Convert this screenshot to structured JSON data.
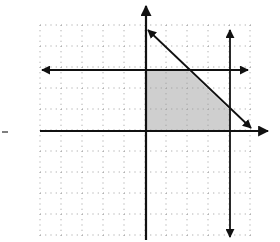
{
  "diagram": {
    "type": "coordinate-plane-linear-inequalities",
    "grid": {
      "x_min_px": 40,
      "x_max_px": 252,
      "y_min_px": 25,
      "y_max_px": 238,
      "major_step_px": 21,
      "minor_divisions": 4,
      "style": "dotted",
      "color": "#9a9a9a"
    },
    "axes": {
      "x_axis": {
        "y_px": 131,
        "from_x": 40,
        "to_x": 268,
        "arrow": "right"
      },
      "y_axis": {
        "x_px": 146,
        "from_y": 6,
        "to_y": 240,
        "arrow": "up"
      }
    },
    "lines": [
      {
        "name": "horizontal-boundary",
        "x1": 42,
        "y1": 70,
        "x2": 248,
        "y2": 70,
        "arrows": "both"
      },
      {
        "name": "vertical-boundary",
        "x1": 230,
        "y1": 30,
        "x2": 230,
        "y2": 237,
        "arrows": "both"
      },
      {
        "name": "diagonal-boundary",
        "x1": 148,
        "y1": 30,
        "x2": 251,
        "y2": 128,
        "arrows": "both"
      }
    ],
    "shaded_region": {
      "points": [
        [
          147,
          70
        ],
        [
          188,
          70
        ],
        [
          230,
          110
        ],
        [
          230,
          131
        ],
        [
          147,
          131
        ]
      ],
      "fill": "#cfcfcf"
    },
    "stray_mark": {
      "x": 2,
      "y": 132,
      "width": 6
    },
    "colors": {
      "line": "#111111",
      "background": "#ffffff",
      "shade": "#cfcfcf"
    }
  }
}
